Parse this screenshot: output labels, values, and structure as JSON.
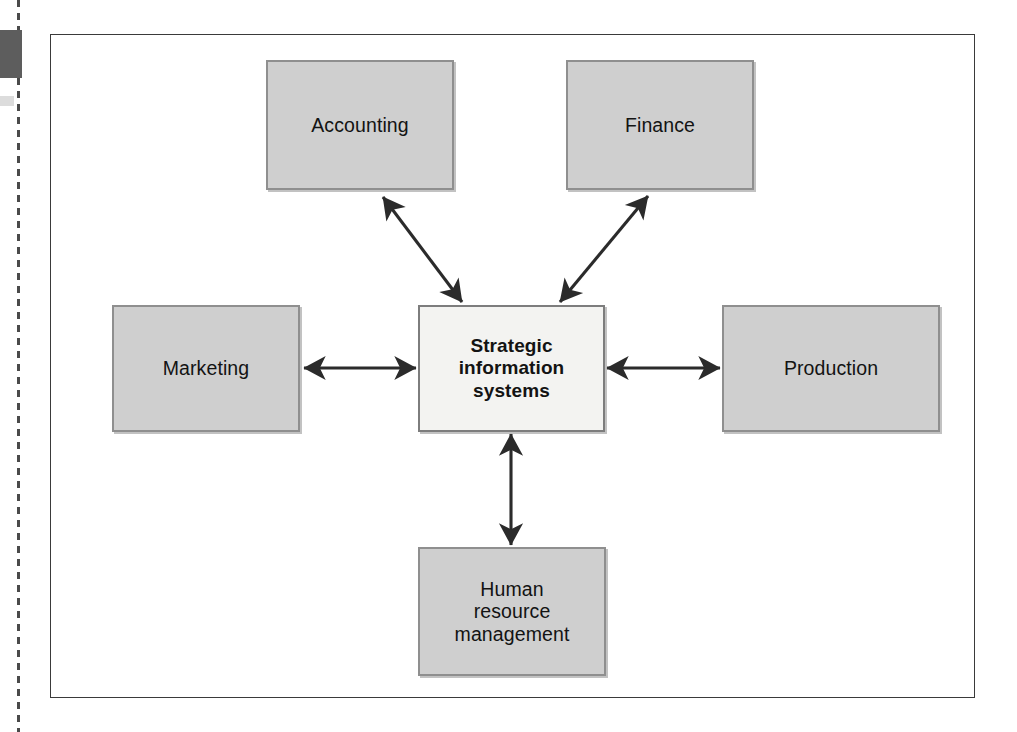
{
  "figure": {
    "type": "hub-and-spoke-diagram",
    "title_visible": false,
    "frame": {
      "border_color": "#3a3a3a",
      "background": "#ffffff"
    },
    "palette": {
      "department_fill": "#cfcfcf",
      "department_border": "#8f8f8f",
      "center_fill": "#f3f3f1",
      "center_border": "#7d7d7d",
      "arrow_color": "#2b2b2b",
      "text_color": "#131313",
      "scan_artifact_dark": "#5d5d5d",
      "scan_artifact_rule": "#4a4a4a"
    },
    "center_node": {
      "id": "strategic-information-systems",
      "lines": [
        "Strategic",
        "information",
        "systems"
      ],
      "text": "Strategic information systems",
      "emphasis": "bold"
    },
    "department_nodes": [
      {
        "id": "accounting",
        "lines": [
          "Accounting"
        ],
        "text": "Accounting",
        "position": "top-left"
      },
      {
        "id": "finance",
        "lines": [
          "Finance"
        ],
        "text": "Finance",
        "position": "top-right"
      },
      {
        "id": "marketing",
        "lines": [
          "Marketing"
        ],
        "text": "Marketing",
        "position": "left"
      },
      {
        "id": "production",
        "lines": [
          "Production"
        ],
        "text": "Production",
        "position": "right"
      },
      {
        "id": "hrm",
        "lines": [
          "Human",
          "resource",
          "management"
        ],
        "text": "Human resource management",
        "position": "bottom"
      }
    ],
    "connectors": [
      {
        "from": "strategic-information-systems",
        "to": "accounting",
        "style": "double-headed-arrow",
        "orientation": "diagonal-up-left"
      },
      {
        "from": "strategic-information-systems",
        "to": "finance",
        "style": "double-headed-arrow",
        "orientation": "diagonal-up-right"
      },
      {
        "from": "strategic-information-systems",
        "to": "marketing",
        "style": "double-headed-arrow",
        "orientation": "horizontal-left"
      },
      {
        "from": "strategic-information-systems",
        "to": "production",
        "style": "double-headed-arrow",
        "orientation": "horizontal-right"
      },
      {
        "from": "strategic-information-systems",
        "to": "hrm",
        "style": "double-headed-arrow",
        "orientation": "vertical-down"
      }
    ]
  }
}
